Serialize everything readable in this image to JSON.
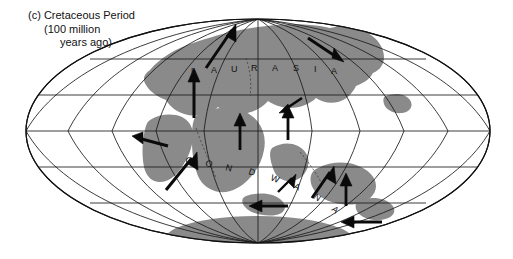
{
  "figure": {
    "panel_letter": "(c)",
    "caption_line1": "(c) Cretaceous Period",
    "caption_line2": "(100 million",
    "caption_line3": "years ago)",
    "period_name": "Cretaceous Period",
    "age_text": "100 million years ago",
    "projection": "Mollweide (elliptical equal-area)",
    "background_color": "#ffffff",
    "land_color": "#8a8a8a",
    "graticule_color": "#1a1a1a",
    "outline_color": "#111111",
    "arrow_color": "#0a0a0a"
  },
  "labels": {
    "laurasia": "LAURASIA",
    "laurasia_letters": [
      "L",
      "A",
      "U",
      "R",
      "A",
      "S",
      "I",
      "A"
    ],
    "gondwana": "GONDWANA",
    "gondwana_letters": [
      "G",
      "O",
      "N",
      "D",
      "W",
      "A",
      "N",
      "A"
    ]
  },
  "graticule": {
    "meridian_interval_deg": 30,
    "parallel_interval_deg": 30,
    "meridians": [
      -180,
      -150,
      -120,
      -90,
      -60,
      -30,
      0,
      30,
      60,
      90,
      120,
      150,
      180
    ],
    "parallels": [
      -60,
      -30,
      0,
      30,
      60
    ],
    "equator_label": "equator"
  },
  "plate_arrows": [
    {
      "name": "north-america-north",
      "direction": "north"
    },
    {
      "name": "north-atlantic-northeast",
      "direction": "northeast"
    },
    {
      "name": "eurasia-east",
      "direction": "southeast"
    },
    {
      "name": "africa-west",
      "direction": "west"
    },
    {
      "name": "south-america-northeast",
      "direction": "northeast"
    },
    {
      "name": "india-north",
      "direction": "north"
    },
    {
      "name": "gondwana-south-east",
      "direction": "northeast"
    },
    {
      "name": "australia-north",
      "direction": "north"
    },
    {
      "name": "antarctica-west",
      "direction": "west"
    },
    {
      "name": "antarctica-southwest",
      "direction": "west"
    },
    {
      "name": "indian-ocean-north",
      "direction": "north"
    },
    {
      "name": "pacific-northeast",
      "direction": "northeast"
    }
  ]
}
